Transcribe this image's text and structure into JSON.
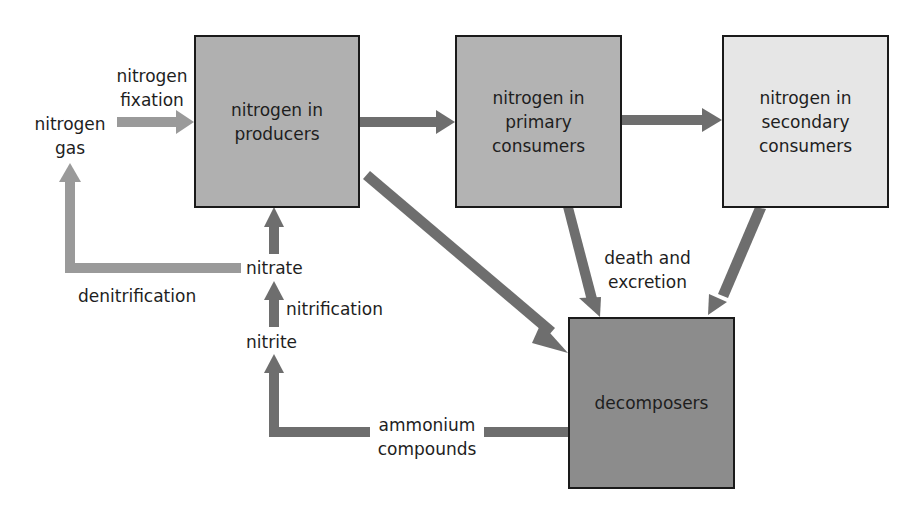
{
  "colors": {
    "producers_fill": "#b0b0b0",
    "primary_fill": "#b3b3b3",
    "secondary_fill": "#e6e6e6",
    "decomposers_fill": "#8c8c8c",
    "dark_arrow": "#6e6e6e",
    "light_arrow": "#9a9a9a",
    "border": "#1a1a1a"
  },
  "boxes": {
    "producers": {
      "line1": "nitrogen in",
      "line2": "producers"
    },
    "primary": {
      "line1": "nitrogen in",
      "line2": "primary",
      "line3": "consumers"
    },
    "secondary": {
      "line1": "nitrogen in",
      "line2": "secondary",
      "line3": "consumers"
    },
    "decomposers": {
      "line1": "decomposers"
    }
  },
  "labels": {
    "nitrogen_gas": {
      "line1": "nitrogen",
      "line2": "gas"
    },
    "nitrogen_fixation": {
      "line1": "nitrogen",
      "line2": "fixation"
    },
    "nitrate": "nitrate",
    "nitrite": "nitrite",
    "denitrification": "denitrification",
    "nitrification": "nitrification",
    "death_excretion": {
      "line1": "death and",
      "line2": "excretion"
    },
    "ammonium": {
      "line1": "ammonium",
      "line2": "compounds"
    }
  }
}
